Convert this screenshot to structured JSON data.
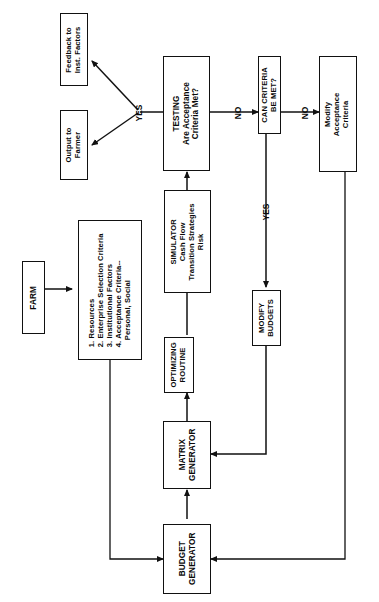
{
  "diagram": {
    "orientation": "rotated-90-ccw",
    "labels": {
      "yes_testing": "YES",
      "no_testing": "NO",
      "no_criteria": "NO",
      "yes_criteria": "YES"
    },
    "nodes": {
      "feedback": {
        "line1": "Feedback to",
        "line2": "Inst. Factors"
      },
      "output": {
        "line1": "Output to",
        "line2": "Farmer"
      },
      "testing": {
        "line1": "TESTING",
        "line2": "Are Acceptance",
        "line3": "Criteria Met?"
      },
      "can_criteria": {
        "line1": "CAN CRITERIA",
        "line2": "BE MET?"
      },
      "modify_acceptance": {
        "line1": "Modify",
        "line2": "Acceptance",
        "line3": "Criteria"
      },
      "farm": {
        "line1": "FARM"
      },
      "criteria_list": {
        "item1": "1. Resources",
        "item2": "2. Enterprise Selection Criteria",
        "item3": "3. Institutional Factors",
        "item4": "4. Acceptance Criteria--",
        "item5": "Personal, Social"
      },
      "simulator": {
        "line1": "SIMULATOR",
        "line2": "Cash Flow",
        "line3": "Transition Strategies",
        "line4": "Risk"
      },
      "optimizing": {
        "line1": "OPTIMIZING",
        "line2": "ROUTINE"
      },
      "modify_budgets": {
        "line1": "MODIFY",
        "line2": "BUDGETS"
      },
      "matrix": {
        "line1": "MATRIX",
        "line2": "GENERATOR"
      },
      "budget": {
        "line1": "BUDGET",
        "line2": "GENERATOR"
      }
    },
    "colors": {
      "ink": "#111111",
      "paper": "#ffffff"
    }
  }
}
